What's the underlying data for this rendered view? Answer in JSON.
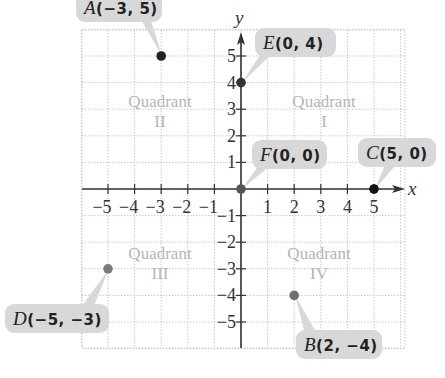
{
  "axes": {
    "x_label": "x",
    "y_label": "y",
    "x_ticks": [
      "-5",
      "-4",
      "-3",
      "-2",
      "-1",
      "1",
      "2",
      "3",
      "4",
      "5"
    ],
    "y_ticks": [
      "5",
      "4",
      "3",
      "2",
      "1",
      "-1",
      "-2",
      "-3",
      "-4",
      "-5"
    ],
    "range": [
      -5,
      5
    ]
  },
  "quadrants": [
    {
      "name": "Quadrant",
      "numeral": "II"
    },
    {
      "name": "Quadrant",
      "numeral": "I"
    },
    {
      "name": "Quadrant",
      "numeral": "III"
    },
    {
      "name": "Quadrant",
      "numeral": "IV"
    }
  ],
  "points": [
    {
      "letter": "A",
      "coords": "(−3, 5)",
      "x": -3,
      "y": 5,
      "color": "#222222"
    },
    {
      "letter": "B",
      "coords": "(2, −4)",
      "x": 2,
      "y": -4,
      "color": "#6e6e6e"
    },
    {
      "letter": "C",
      "coords": "(5, 0)",
      "x": 5,
      "y": 0,
      "color": "#111111"
    },
    {
      "letter": "D",
      "coords": "(−5, −3)",
      "x": -5,
      "y": -3,
      "color": "#7a7a7a"
    },
    {
      "letter": "E",
      "coords": "(0, 4)",
      "x": 0,
      "y": 4,
      "color": "#333333"
    },
    {
      "letter": "F",
      "coords": "(0, 0)",
      "x": 0,
      "y": 0,
      "color": "#555555"
    }
  ],
  "colors": {
    "grid": "#c8c8c8",
    "axis": "#333333",
    "callout_bg": "#d8d8d8",
    "quadrant_text": "#b5b5b5"
  }
}
